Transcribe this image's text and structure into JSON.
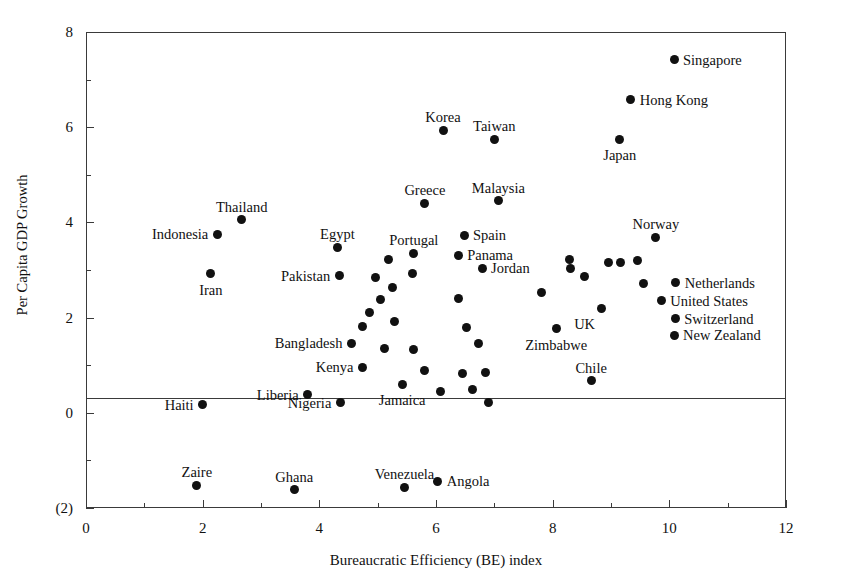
{
  "chart_data": {
    "type": "scatter",
    "title": "",
    "xlabel": "Bureaucratic Efficiency (BE) index",
    "ylabel": "Per Capita GDP Growth",
    "xlim": [
      0,
      12
    ],
    "ylim": [
      -2,
      8
    ],
    "xticks": [
      "0",
      "2",
      "4",
      "6",
      "8",
      "10",
      "12"
    ],
    "xtick_values": [
      0,
      2,
      4,
      6,
      8,
      10,
      12
    ],
    "yticks": [
      "8",
      "6",
      "4",
      "2",
      "0",
      "(2)"
    ],
    "ytick_values": [
      8,
      6,
      4,
      2,
      0,
      -2
    ],
    "grid": false,
    "legend": null,
    "zero_reference_line": 0,
    "points": [
      {
        "label": "Singapore",
        "x": 10.08,
        "y": 7.42,
        "label_pos": "right"
      },
      {
        "label": "Hong Kong",
        "x": 9.34,
        "y": 6.58,
        "label_pos": "right"
      },
      {
        "label": "Japan",
        "x": 9.15,
        "y": 5.75,
        "label_pos": "below"
      },
      {
        "label": "Korea",
        "x": 6.12,
        "y": 5.94,
        "label_pos": "above"
      },
      {
        "label": "Taiwan",
        "x": 7.0,
        "y": 5.75,
        "label_pos": "above"
      },
      {
        "label": "Malaysia",
        "x": 7.07,
        "y": 4.46,
        "label_pos": "above"
      },
      {
        "label": "Greece",
        "x": 5.81,
        "y": 4.4,
        "label_pos": "above"
      },
      {
        "label": "Thailand",
        "x": 2.67,
        "y": 4.06,
        "label_pos": "above"
      },
      {
        "label": "Indonesia",
        "x": 2.25,
        "y": 3.75,
        "label_pos": "left"
      },
      {
        "label": "Norway",
        "x": 9.77,
        "y": 3.69,
        "label_pos": "above"
      },
      {
        "label": "Spain",
        "x": 6.48,
        "y": 3.73,
        "label_pos": "right"
      },
      {
        "label": "Portugal",
        "x": 5.62,
        "y": 3.35,
        "label_pos": "above"
      },
      {
        "label": "Egypt",
        "x": 4.31,
        "y": 3.48,
        "label_pos": "above"
      },
      {
        "label": "Panama",
        "x": 6.38,
        "y": 3.31,
        "label_pos": "right"
      },
      {
        "label": "Iran",
        "x": 2.14,
        "y": 2.92,
        "label_pos": "below"
      },
      {
        "label": "Pakistan",
        "x": 4.34,
        "y": 2.88,
        "label_pos": "left"
      },
      {
        "label": "Jordan",
        "x": 6.79,
        "y": 3.04,
        "label_pos": "right"
      },
      {
        "label": "Netherlands",
        "x": 10.11,
        "y": 2.73,
        "label_pos": "right"
      },
      {
        "label": "United States",
        "x": 9.86,
        "y": 2.35,
        "label_pos": "right"
      },
      {
        "label": "Switzerland",
        "x": 10.1,
        "y": 1.98,
        "label_pos": "right"
      },
      {
        "label": "New Zealand",
        "x": 10.08,
        "y": 1.63,
        "label_pos": "right"
      },
      {
        "label": "Zimbabwe",
        "x": 8.06,
        "y": 1.77,
        "label_pos": "below"
      },
      {
        "label": "Chile",
        "x": 8.66,
        "y": 0.67,
        "label_pos": "above"
      },
      {
        "label": "UK",
        "x": 8.83,
        "y": 2.19,
        "label_pos": "below-left"
      },
      {
        "label": "Bangladesh",
        "x": 4.55,
        "y": 1.46,
        "label_pos": "left"
      },
      {
        "label": "Kenya",
        "x": 4.74,
        "y": 0.96,
        "label_pos": "left"
      },
      {
        "label": "Nigeria",
        "x": 4.36,
        "y": 0.21,
        "label_pos": "left"
      },
      {
        "label": "Jamaica",
        "x": 5.42,
        "y": 0.6,
        "label_pos": "below"
      },
      {
        "label": "Haiti",
        "x": 2.0,
        "y": 0.17,
        "label_pos": "left"
      },
      {
        "label": "Liberia",
        "x": 3.8,
        "y": 0.38,
        "label_pos": "left"
      },
      {
        "label": "Zaire",
        "x": 1.9,
        "y": -1.52,
        "label_pos": "above"
      },
      {
        "label": "Ghana",
        "x": 3.57,
        "y": -1.62,
        "label_pos": "above"
      },
      {
        "label": "Venezuela",
        "x": 5.46,
        "y": -1.56,
        "label_pos": "above"
      },
      {
        "label": "Angola",
        "x": 6.03,
        "y": -1.44,
        "label_pos": "right"
      },
      {
        "label": "",
        "x": 5.18,
        "y": 3.23,
        "label_pos": "none"
      },
      {
        "label": "",
        "x": 5.59,
        "y": 2.93,
        "label_pos": "none"
      },
      {
        "label": "",
        "x": 5.25,
        "y": 2.64,
        "label_pos": "none"
      },
      {
        "label": "",
        "x": 4.97,
        "y": 2.85,
        "label_pos": "none"
      },
      {
        "label": "",
        "x": 5.04,
        "y": 2.38,
        "label_pos": "none"
      },
      {
        "label": "",
        "x": 4.86,
        "y": 2.1,
        "label_pos": "none"
      },
      {
        "label": "",
        "x": 4.74,
        "y": 1.81,
        "label_pos": "none"
      },
      {
        "label": "",
        "x": 5.28,
        "y": 1.92,
        "label_pos": "none"
      },
      {
        "label": "",
        "x": 5.11,
        "y": 1.35,
        "label_pos": "none"
      },
      {
        "label": "",
        "x": 5.62,
        "y": 1.33,
        "label_pos": "none"
      },
      {
        "label": "",
        "x": 5.8,
        "y": 0.88,
        "label_pos": "none"
      },
      {
        "label": "",
        "x": 6.07,
        "y": 0.44,
        "label_pos": "none"
      },
      {
        "label": "",
        "x": 6.38,
        "y": 2.4,
        "label_pos": "none"
      },
      {
        "label": "",
        "x": 6.52,
        "y": 1.79,
        "label_pos": "none"
      },
      {
        "label": "",
        "x": 6.73,
        "y": 1.46,
        "label_pos": "none"
      },
      {
        "label": "",
        "x": 6.45,
        "y": 0.83,
        "label_pos": "none"
      },
      {
        "label": "",
        "x": 6.84,
        "y": 0.85,
        "label_pos": "none"
      },
      {
        "label": "",
        "x": 6.63,
        "y": 0.5,
        "label_pos": "none"
      },
      {
        "label": "",
        "x": 6.9,
        "y": 0.21,
        "label_pos": "none"
      },
      {
        "label": "",
        "x": 7.8,
        "y": 2.52,
        "label_pos": "none"
      },
      {
        "label": "",
        "x": 8.29,
        "y": 3.22,
        "label_pos": "none"
      },
      {
        "label": "",
        "x": 8.31,
        "y": 3.04,
        "label_pos": "none"
      },
      {
        "label": "",
        "x": 8.95,
        "y": 3.15,
        "label_pos": "none"
      },
      {
        "label": "",
        "x": 9.17,
        "y": 3.15,
        "label_pos": "none"
      },
      {
        "label": "",
        "x": 9.46,
        "y": 3.19,
        "label_pos": "none"
      },
      {
        "label": "",
        "x": 8.55,
        "y": 2.86,
        "label_pos": "none"
      },
      {
        "label": "",
        "x": 9.55,
        "y": 2.71,
        "label_pos": "none"
      }
    ]
  },
  "axes": {
    "y_title": "Per Capita GDP Growth",
    "x_title": "Bureaucratic Efficiency (BE) index"
  }
}
